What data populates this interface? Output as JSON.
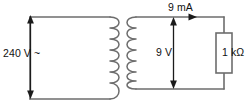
{
  "figure": {
    "line_color": "#6d6d6d",
    "text_color": "#111111",
    "background": "#ffffff"
  },
  "labels": {
    "primary_voltage": "240 V ~",
    "current": "9 mA",
    "secondary_voltage": "9 V",
    "resistance": "1 kΩ"
  },
  "components": {
    "primary_coil": "transformer-primary-winding",
    "secondary_coil": "transformer-secondary-winding",
    "resistor": "resistor-1-kilohm",
    "primary_voltage_arrow": "double-headed-vertical-arrow",
    "secondary_voltage_arrow": "double-headed-vertical-arrow",
    "current_arrow": "rightward-arrow"
  }
}
